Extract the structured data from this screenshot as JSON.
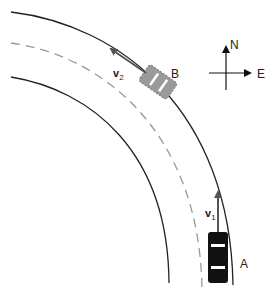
{
  "diagram": {
    "type": "road-curve-vectors",
    "compass": {
      "north_label": "N",
      "east_label": "E"
    },
    "cars": [
      {
        "id": "A",
        "label": "A",
        "fill": "#111111",
        "velocity_label": "v",
        "velocity_sub": "1",
        "velocity_direction": "north"
      },
      {
        "id": "B",
        "label": "B",
        "fill": "#999999",
        "velocity_label": "v",
        "velocity_sub": "2",
        "velocity_direction": "northwest"
      }
    ],
    "road": {
      "edges": "solid",
      "center_line": "dashed",
      "edge_color": "#222222",
      "center_color": "#999999"
    }
  }
}
